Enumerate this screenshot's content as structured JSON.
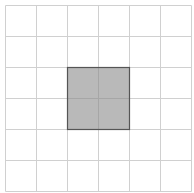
{
  "grid": {
    "rows": 6,
    "cols": 6,
    "origin_x": 5,
    "origin_y": 5,
    "cell_size": 31,
    "line_color": "#d0d0d0",
    "background": "#ffffff"
  },
  "highlight": {
    "col": 2,
    "row": 2,
    "col_span": 2,
    "row_span": 2,
    "fill": "#b9b9b9",
    "border": "#555555",
    "inner_line_color": "#a6a6a6"
  }
}
